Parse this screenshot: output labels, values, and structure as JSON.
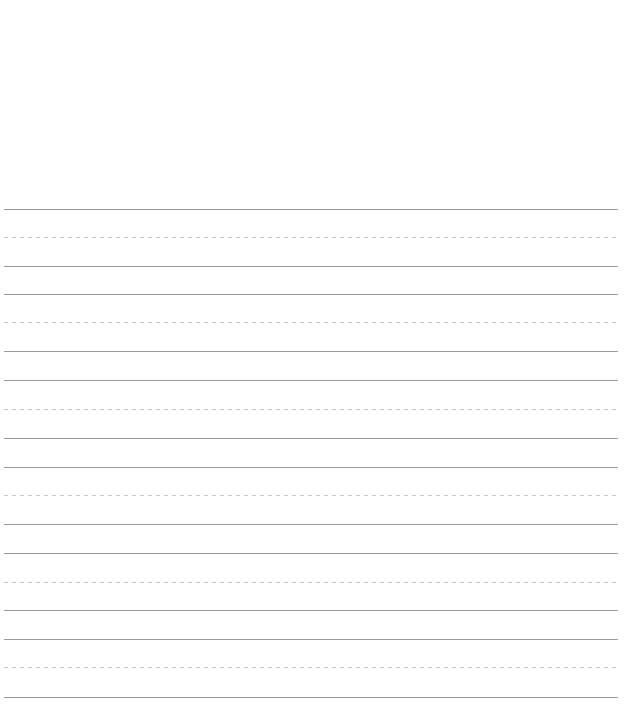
{
  "page": {
    "type": "handwriting-practice-sheet",
    "background_color": "#ffffff",
    "header_area": "blank"
  },
  "ruling": {
    "solid_color": "#9a9a9a",
    "dashed_color": "#c4c4c4",
    "left": 4,
    "right": 618,
    "dash_length": 4,
    "dash_gap": 4,
    "groups": [
      {
        "top": 209,
        "mid": 237,
        "base": 266
      },
      {
        "top": 294,
        "mid": 322,
        "base": 351
      },
      {
        "top": 380,
        "mid": 409,
        "base": 438
      },
      {
        "top": 467,
        "mid": 495,
        "base": 524
      },
      {
        "top": 553,
        "mid": 582,
        "base": 610
      },
      {
        "top": 639,
        "mid": 667,
        "base": 697
      }
    ]
  }
}
